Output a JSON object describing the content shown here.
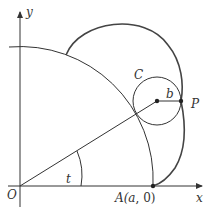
{
  "diagram": {
    "type": "geometry",
    "colors": {
      "stroke": "#333333",
      "curve": "#444444",
      "background": "#ffffff"
    },
    "labels": {
      "y_axis": "y",
      "x_axis": "x",
      "origin": "O",
      "angle": "t",
      "circle": "C",
      "radius": "b",
      "point": "P",
      "point_a_prefix": "A(",
      "point_a_var": "a",
      "point_a_suffix": ", 0)"
    },
    "points": {
      "origin": [
        20,
        186
      ],
      "A": [
        153,
        186
      ],
      "small_circle_center": [
        157,
        101
      ],
      "P": [
        181,
        101
      ]
    },
    "radii": {
      "large_circle_a": 133,
      "small_circle_b": 24
    }
  }
}
